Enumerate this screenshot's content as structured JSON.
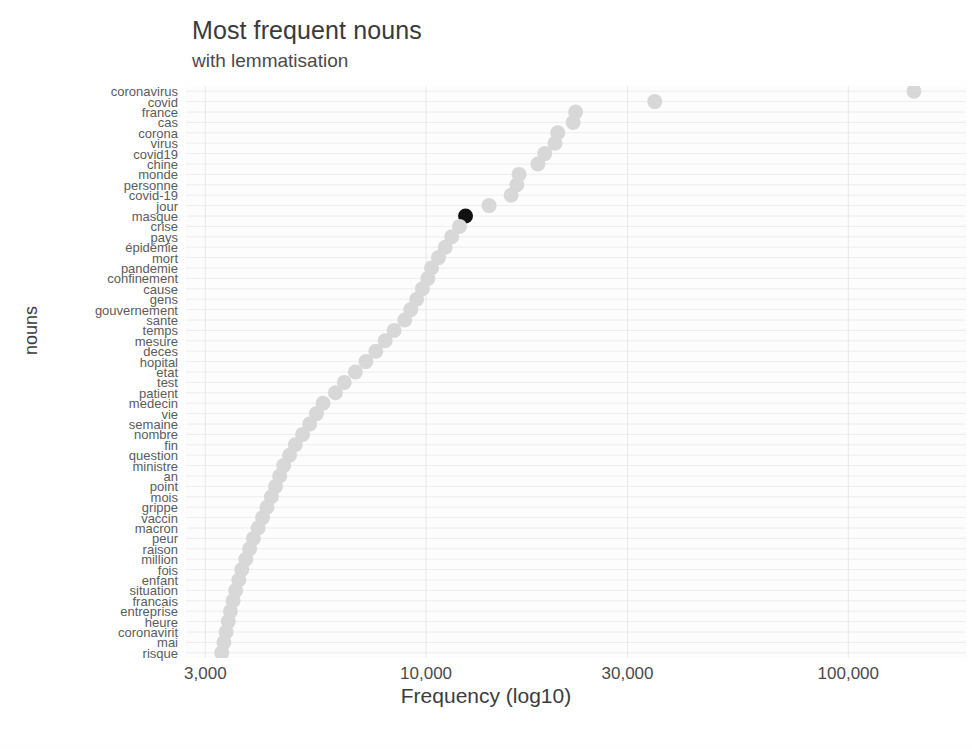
{
  "chart_data": {
    "type": "scatter",
    "title": "Most frequent nouns",
    "subtitle": "with lemmatisation",
    "xlabel": "Frequency (log10)",
    "ylabel": "nouns",
    "x_scale": "log10",
    "xlim": [
      2700,
      190000
    ],
    "grid": true,
    "legend": "none",
    "point_color": "#d8d8d8",
    "highlight_color": "#111111",
    "highlight_category": "masque",
    "x_ticks": [
      {
        "label": "3,000",
        "value": 3000
      },
      {
        "label": "10,000",
        "value": 10000
      },
      {
        "label": "30,000",
        "value": 30000
      },
      {
        "label": "100,000",
        "value": 100000
      }
    ],
    "categories": [
      "coronavirus",
      "covid",
      "france",
      "cas",
      "corona",
      "virus",
      "covid19",
      "chine",
      "monde",
      "personne",
      "covid-19",
      "jour",
      "masque",
      "crise",
      "pays",
      "épidémie",
      "mort",
      "pandemie",
      "confinement",
      "cause",
      "gens",
      "gouvernement",
      "sante",
      "temps",
      "mesure",
      "deces",
      "hopital",
      "etat",
      "test",
      "patient",
      "medecin",
      "vie",
      "semaine",
      "nombre",
      "fin",
      "question",
      "ministre",
      "an",
      "point",
      "mois",
      "grippe",
      "vaccin",
      "macron",
      "peur",
      "raison",
      "million",
      "fois",
      "enfant",
      "situation",
      "francais",
      "entreprise",
      "heure",
      "coronavirit",
      "mai",
      "risque"
    ],
    "values": [
      143000,
      34800,
      22600,
      22300,
      20500,
      20200,
      19100,
      18400,
      16600,
      16400,
      15900,
      14100,
      12400,
      12000,
      11500,
      11100,
      10700,
      10300,
      10100,
      9800,
      9500,
      9200,
      8900,
      8400,
      8000,
      7600,
      7200,
      6800,
      6400,
      6100,
      5700,
      5500,
      5300,
      5100,
      4900,
      4750,
      4600,
      4500,
      4400,
      4300,
      4200,
      4100,
      4000,
      3900,
      3820,
      3740,
      3660,
      3600,
      3540,
      3490,
      3440,
      3400,
      3360,
      3320,
      3280
    ]
  }
}
